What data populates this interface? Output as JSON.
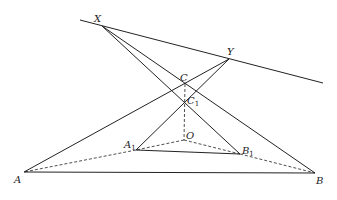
{
  "diagram": {
    "type": "geometry-construction",
    "colors": {
      "line": "#222222",
      "background": "#ffffff"
    },
    "points": {
      "X": {
        "label": "X",
        "sub": "",
        "x": 102,
        "y": 26,
        "lx": 94,
        "ly": 14
      },
      "Y": {
        "label": "Y",
        "sub": "",
        "x": 229,
        "y": 59,
        "lx": 227,
        "ly": 47
      },
      "C": {
        "label": "C",
        "sub": "",
        "x": 185,
        "y": 84,
        "lx": 180,
        "ly": 73
      },
      "C1": {
        "label": "C",
        "sub": "1",
        "x": 185,
        "y": 102,
        "lx": 187,
        "ly": 96
      },
      "O": {
        "label": "O",
        "sub": "",
        "x": 184,
        "y": 140,
        "lx": 186,
        "ly": 131
      },
      "A1": {
        "label": "A",
        "sub": "1",
        "x": 136,
        "y": 150,
        "lx": 124,
        "ly": 140
      },
      "B1": {
        "label": "B",
        "sub": "1",
        "x": 240,
        "y": 154,
        "lx": 242,
        "ly": 146
      },
      "A": {
        "label": "A",
        "sub": "",
        "x": 24,
        "y": 172,
        "lx": 14,
        "ly": 175
      },
      "B": {
        "label": "B",
        "sub": "",
        "x": 315,
        "y": 173,
        "lx": 316,
        "ly": 176
      }
    },
    "solid_segments": [
      {
        "x1": 80,
        "y1": 20,
        "x2": 323,
        "y2": 83
      },
      {
        "x1": 102,
        "y1": 26,
        "x2": 315,
        "y2": 173
      },
      {
        "x1": 102,
        "y1": 26,
        "x2": 240,
        "y2": 154
      },
      {
        "x1": 229,
        "y1": 59,
        "x2": 24,
        "y2": 172
      },
      {
        "x1": 229,
        "y1": 59,
        "x2": 136,
        "y2": 150
      },
      {
        "x1": 24,
        "y1": 172,
        "x2": 315,
        "y2": 173
      },
      {
        "x1": 136,
        "y1": 150,
        "x2": 240,
        "y2": 154
      }
    ],
    "dashed_segments": [
      {
        "x1": 185,
        "y1": 84,
        "x2": 184,
        "y2": 140
      },
      {
        "x1": 184,
        "y1": 140,
        "x2": 136,
        "y2": 150
      },
      {
        "x1": 184,
        "y1": 140,
        "x2": 240,
        "y2": 154
      },
      {
        "x1": 136,
        "y1": 150,
        "x2": 24,
        "y2": 172
      },
      {
        "x1": 240,
        "y1": 154,
        "x2": 315,
        "y2": 173
      }
    ]
  }
}
